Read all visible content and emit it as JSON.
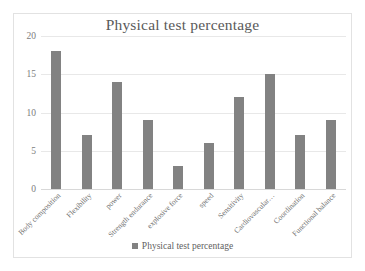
{
  "chart_data": {
    "type": "bar",
    "title": "Physical test percentage",
    "xlabel": "",
    "ylabel": "",
    "ylim": [
      0,
      20
    ],
    "yticks": [
      0,
      5,
      10,
      15,
      20
    ],
    "grid": true,
    "legend_position": "bottom",
    "categories": [
      "Body composition",
      "Flexibility",
      "power",
      "Strength endurance",
      "explosive force",
      "speed",
      "Sensitivity",
      "Cardiovascular…",
      "Coordination",
      "Functional balance"
    ],
    "series": [
      {
        "name": "Physical test percentage",
        "color": "#828282",
        "values": [
          18,
          7,
          14,
          9,
          3,
          6,
          12,
          15,
          7,
          9
        ]
      }
    ]
  },
  "legend": {
    "entries": [
      {
        "label": "Physical test percentage",
        "marker": "square-marker",
        "color": "#828282"
      }
    ]
  },
  "colors": {
    "bar": "#828282",
    "gridline": "#e8e8e8",
    "frame": "#e2e2e2",
    "text": "#5a5a5a",
    "background": "#ffffff"
  }
}
